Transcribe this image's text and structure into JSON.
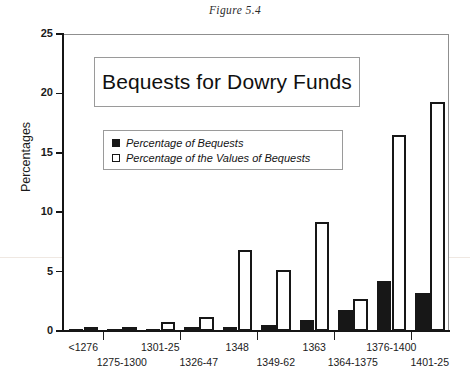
{
  "figure": {
    "caption": "Figure 5.4"
  },
  "chart_data": {
    "type": "bar",
    "title": "Bequests for Dowry Funds",
    "xlabel": "",
    "ylabel": "Percentages",
    "ylim": [
      0,
      25
    ],
    "ytick_labels": [
      "0",
      "5",
      "10",
      "15",
      "20",
      "25"
    ],
    "yticks": [
      0,
      5,
      10,
      15,
      20,
      25
    ],
    "grid": false,
    "legend_position": "upper-left-inside",
    "categories": [
      "<1276",
      "1275-1300",
      "1301-25",
      "1326-47",
      "1348",
      "1349-62",
      "1363",
      "1364-1375",
      "1376-1400",
      "1401-25"
    ],
    "series": [
      {
        "name": "Percentage of Bequests",
        "color": "#171717",
        "fill": "solid",
        "values": [
          0.05,
          0.2,
          0.2,
          0.3,
          0.3,
          0.5,
          0.9,
          1.8,
          4.2,
          3.2
        ]
      },
      {
        "name": "Percentage of the Values of Bequests",
        "color": "#ffffff",
        "fill": "outline",
        "values": [
          0.05,
          0.3,
          0.8,
          1.2,
          6.8,
          5.1,
          9.2,
          2.7,
          16.5,
          19.3
        ]
      }
    ]
  },
  "colors": {
    "series_dark": "#171717",
    "series_light": "#ffffff",
    "axis": "#151515",
    "frame": "#8f8f8f"
  }
}
